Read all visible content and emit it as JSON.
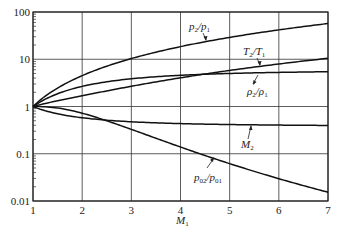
{
  "chart_data": {
    "type": "line",
    "title": "",
    "xlabel": "M1",
    "ylabel": "",
    "xlim": [
      1,
      7
    ],
    "ylim": [
      0.01,
      100
    ],
    "yscale": "log",
    "grid": true,
    "x_ticks": [
      "1",
      "2",
      "3",
      "4",
      "5",
      "6",
      "7"
    ],
    "y_ticks": [
      "0.01",
      "0.1",
      "1",
      "10",
      "100"
    ],
    "x": [
      1,
      1.5,
      2,
      2.5,
      3,
      3.5,
      4,
      4.5,
      5,
      5.5,
      6,
      6.5,
      7
    ],
    "series": [
      {
        "name": "p2/p1",
        "values": [
          1.0,
          2.458,
          4.5,
          7.125,
          10.333,
          14.125,
          18.5,
          23.458,
          29.0,
          35.125,
          41.833,
          49.125,
          57.0
        ]
      },
      {
        "name": "T2/T1",
        "values": [
          1.0,
          1.32,
          1.687,
          2.137,
          2.679,
          3.315,
          4.047,
          4.875,
          5.8,
          6.822,
          7.941,
          9.156,
          10.469
        ]
      },
      {
        "name": "rho2/rho1",
        "values": [
          1.0,
          1.862,
          2.667,
          3.333,
          3.857,
          4.261,
          4.571,
          4.812,
          5.0,
          5.149,
          5.268,
          5.365,
          5.444
        ]
      },
      {
        "name": "M2",
        "values": [
          1.0,
          0.701,
          0.577,
          0.513,
          0.475,
          0.451,
          0.435,
          0.424,
          0.415,
          0.409,
          0.404,
          0.4,
          0.397
        ]
      },
      {
        "name": "p02/p01",
        "values": [
          1.0,
          0.93,
          0.721,
          0.499,
          0.328,
          0.213,
          0.139,
          0.092,
          0.0617,
          0.0424,
          0.0297,
          0.0211,
          0.0154
        ]
      }
    ],
    "annotations": [
      "p2/p1",
      "T2/T1",
      "rho2/rho1",
      "M2",
      "p02/p01"
    ]
  },
  "labels": {
    "xaxis": "M",
    "xaxis_sub": "1"
  }
}
